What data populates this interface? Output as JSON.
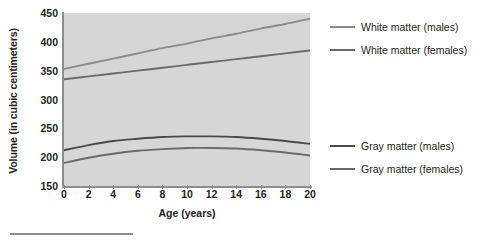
{
  "chart_data": {
    "type": "line",
    "title": "",
    "xlabel": "Age (years)",
    "ylabel": "Volume (in cubic centimeters)",
    "xlim": [
      0,
      20
    ],
    "ylim": [
      150,
      450
    ],
    "xticks": [
      0,
      2,
      4,
      6,
      8,
      10,
      12,
      14,
      16,
      18,
      20
    ],
    "yticks": [
      150,
      200,
      250,
      300,
      350,
      400,
      450
    ],
    "grid": false,
    "legend_position": "right",
    "plot_background": "#d6d6d6",
    "x": [
      0,
      2,
      4,
      6,
      8,
      10,
      12,
      14,
      16,
      18,
      20
    ],
    "series": [
      {
        "name": "White matter (males)",
        "color": "#8c8c8c",
        "values": [
          353,
          362,
          371,
          380,
          389,
          397,
          406,
          414,
          423,
          431,
          440
        ]
      },
      {
        "name": "White matter (females)",
        "color": "#6b6b6b",
        "values": [
          335,
          340,
          345,
          350,
          355,
          360,
          365,
          370,
          375,
          380,
          385
        ]
      },
      {
        "name": "Gray matter (males)",
        "color": "#4a4a4a",
        "values": [
          212,
          221,
          228,
          232,
          235,
          236,
          236,
          235,
          232,
          228,
          223
        ]
      },
      {
        "name": "Gray matter (females)",
        "color": "#6b6b6b",
        "values": [
          190,
          199,
          206,
          211,
          214,
          216,
          216,
          215,
          212,
          208,
          203
        ]
      }
    ]
  },
  "legend": {
    "items": [
      {
        "label": "White matter (males)",
        "color": "#8c8c8c",
        "top": 22
      },
      {
        "label": "White matter (females)",
        "color": "#6b6b6b",
        "top": 45
      },
      {
        "label": "Gray matter (males)",
        "color": "#4a4a4a",
        "top": 141
      },
      {
        "label": "Gray matter (females)",
        "color": "#6b6b6b",
        "top": 164
      }
    ]
  },
  "colors": {
    "axis": "#8d8d8d",
    "text": "#231f20",
    "plot_bg": "#d6d6d6",
    "page_bg": "#ffffff",
    "rule": "#8d8d8d"
  }
}
